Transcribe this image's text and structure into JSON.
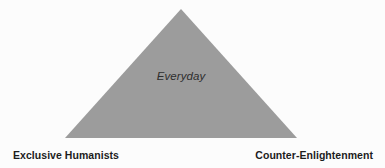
{
  "figure": {
    "type": "triangle-diagram",
    "background_color": "#fcfcfc",
    "triangle": {
      "fill_color": "#9c9c9c",
      "apex": {
        "x": 181,
        "y": 9
      },
      "bottom_left": {
        "x": 65,
        "y": 138
      },
      "bottom_right": {
        "x": 297,
        "y": 138
      },
      "center_label": "Everyday"
    },
    "labels": {
      "left_corner": "Exclusive Humanists",
      "right_corner": "Counter-Enlightenment"
    },
    "text_color": "#1d1d1d",
    "center_text_color": "#2e2e2e"
  }
}
